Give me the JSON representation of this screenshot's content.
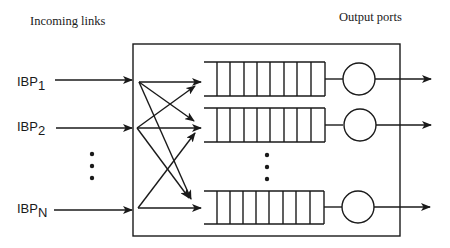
{
  "diagram": {
    "title_left": "Incoming links",
    "title_right": "Output ports",
    "inputs": [
      {
        "label": "IBP",
        "sub": "1",
        "y": 79
      },
      {
        "label": "IBP",
        "sub": "2",
        "y": 125
      },
      {
        "label": "IBP",
        "sub": "N",
        "y": 207
      }
    ],
    "ellipsis_inputs": "⋮",
    "ellipsis_queues": "⋮",
    "queues": [
      {
        "name": "queue-1",
        "y_top": 62,
        "y_bottom": 96,
        "cells": 8
      },
      {
        "name": "queue-2",
        "y_top": 108,
        "y_bottom": 142,
        "cells": 8
      },
      {
        "name": "queue-N",
        "y_top": 191,
        "y_bottom": 224,
        "cells": 8
      }
    ],
    "output_ports": [
      {
        "name": "output-port-1",
        "cy": 79
      },
      {
        "name": "output-port-2",
        "cy": 125
      },
      {
        "name": "output-port-N",
        "cy": 207
      }
    ],
    "switch_box": {
      "x": 133,
      "y": 44,
      "width": 267,
      "height": 192
    },
    "line_color": "#1a1a1a"
  }
}
